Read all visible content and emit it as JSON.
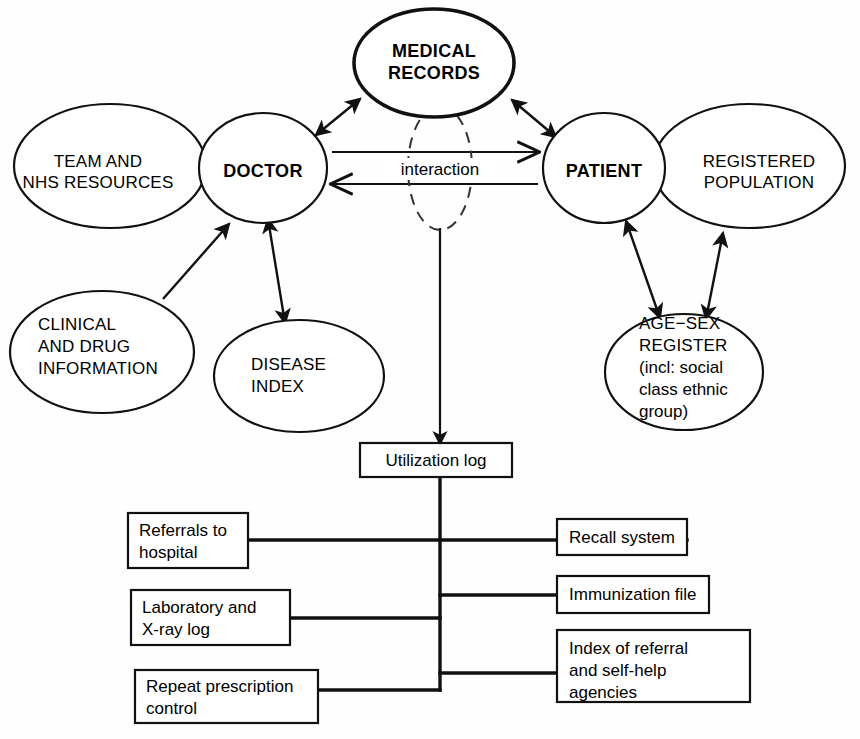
{
  "diagram": {
    "nodes": {
      "medical_records": {
        "line1": "MEDICAL",
        "line2": "RECORDS"
      },
      "doctor": {
        "label": "DOCTOR"
      },
      "patient": {
        "label": "PATIENT"
      },
      "team_nhs": {
        "line1": "TEAM AND",
        "line2": "NHS RESOURCES"
      },
      "registered_population": {
        "line1": "REGISTERED",
        "line2": "POPULATION"
      },
      "clinical_drug": {
        "line1": "CLINICAL",
        "line2": "AND DRUG",
        "line3": "INFORMATION"
      },
      "disease_index": {
        "line1": "DISEASE",
        "line2": "INDEX"
      },
      "age_sex_register": {
        "line1": "AGE−SEX",
        "line2": "REGISTER",
        "line3": "(incl: social",
        "line4": "class ethnic",
        "line5": "group)"
      },
      "interaction": {
        "label": "interaction"
      }
    },
    "boxes": {
      "utilization_log": {
        "label": "Utilization log"
      },
      "referrals": {
        "line1": "Referrals to",
        "line2": "hospital"
      },
      "laboratory": {
        "line1": "Laboratory and",
        "line2": "X-ray log"
      },
      "repeat_prescription": {
        "line1": "Repeat prescription",
        "line2": "control"
      },
      "recall_system": {
        "label": "Recall system"
      },
      "immunization_file": {
        "label": "Immunization file"
      },
      "index_referral": {
        "line1": "Index of referral",
        "line2": "and self-help",
        "line3": "agencies"
      }
    },
    "colors": {
      "stroke": "#111111",
      "background": "#ffffff",
      "dashed_stroke": "#333333"
    }
  }
}
